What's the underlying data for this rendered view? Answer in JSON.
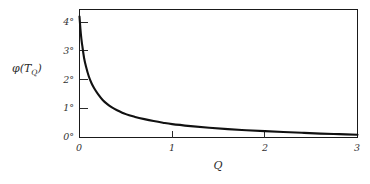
{
  "figure": {
    "background_color": "#ffffff",
    "axis_color": "#1a1a1a",
    "curve_color": "#111111"
  },
  "chart_data": {
    "type": "line",
    "title": "",
    "subtitle": "",
    "xlabel": "Q",
    "ylabel": "φ(T_Q)",
    "ylabel_base": "φ(T",
    "ylabel_sub": "Q",
    "ylabel_close": ")",
    "xlim": [
      0,
      3
    ],
    "ylim": [
      0,
      4.6
    ],
    "grid": false,
    "legend": null,
    "legend_position": "none",
    "x_ticks": [
      0,
      1,
      2,
      3
    ],
    "x_tick_labels": [
      "0",
      "1",
      "2",
      "3"
    ],
    "y_ticks": [
      0,
      1,
      2,
      3,
      4
    ],
    "y_tick_labels": [
      "0°",
      "1°",
      "2°",
      "3°",
      "4°"
    ],
    "y_tick_unit": "°",
    "tick_direction": "in",
    "series": [
      {
        "name": "phi(T_Q)",
        "x": [
          0.0,
          0.01,
          0.02,
          0.03,
          0.05,
          0.07,
          0.1,
          0.13,
          0.16,
          0.2,
          0.25,
          0.3,
          0.35,
          0.4,
          0.5,
          0.6,
          0.7,
          0.8,
          0.9,
          1.0,
          1.2,
          1.4,
          1.6,
          1.8,
          2.0,
          2.2,
          2.4,
          2.6,
          2.8,
          3.0
        ],
        "y": [
          4.35,
          3.9,
          3.55,
          3.3,
          2.85,
          2.55,
          2.2,
          1.95,
          1.76,
          1.56,
          1.35,
          1.2,
          1.08,
          0.99,
          0.84,
          0.74,
          0.66,
          0.59,
          0.53,
          0.48,
          0.41,
          0.35,
          0.3,
          0.26,
          0.23,
          0.2,
          0.17,
          0.14,
          0.12,
          0.1
        ]
      }
    ]
  }
}
